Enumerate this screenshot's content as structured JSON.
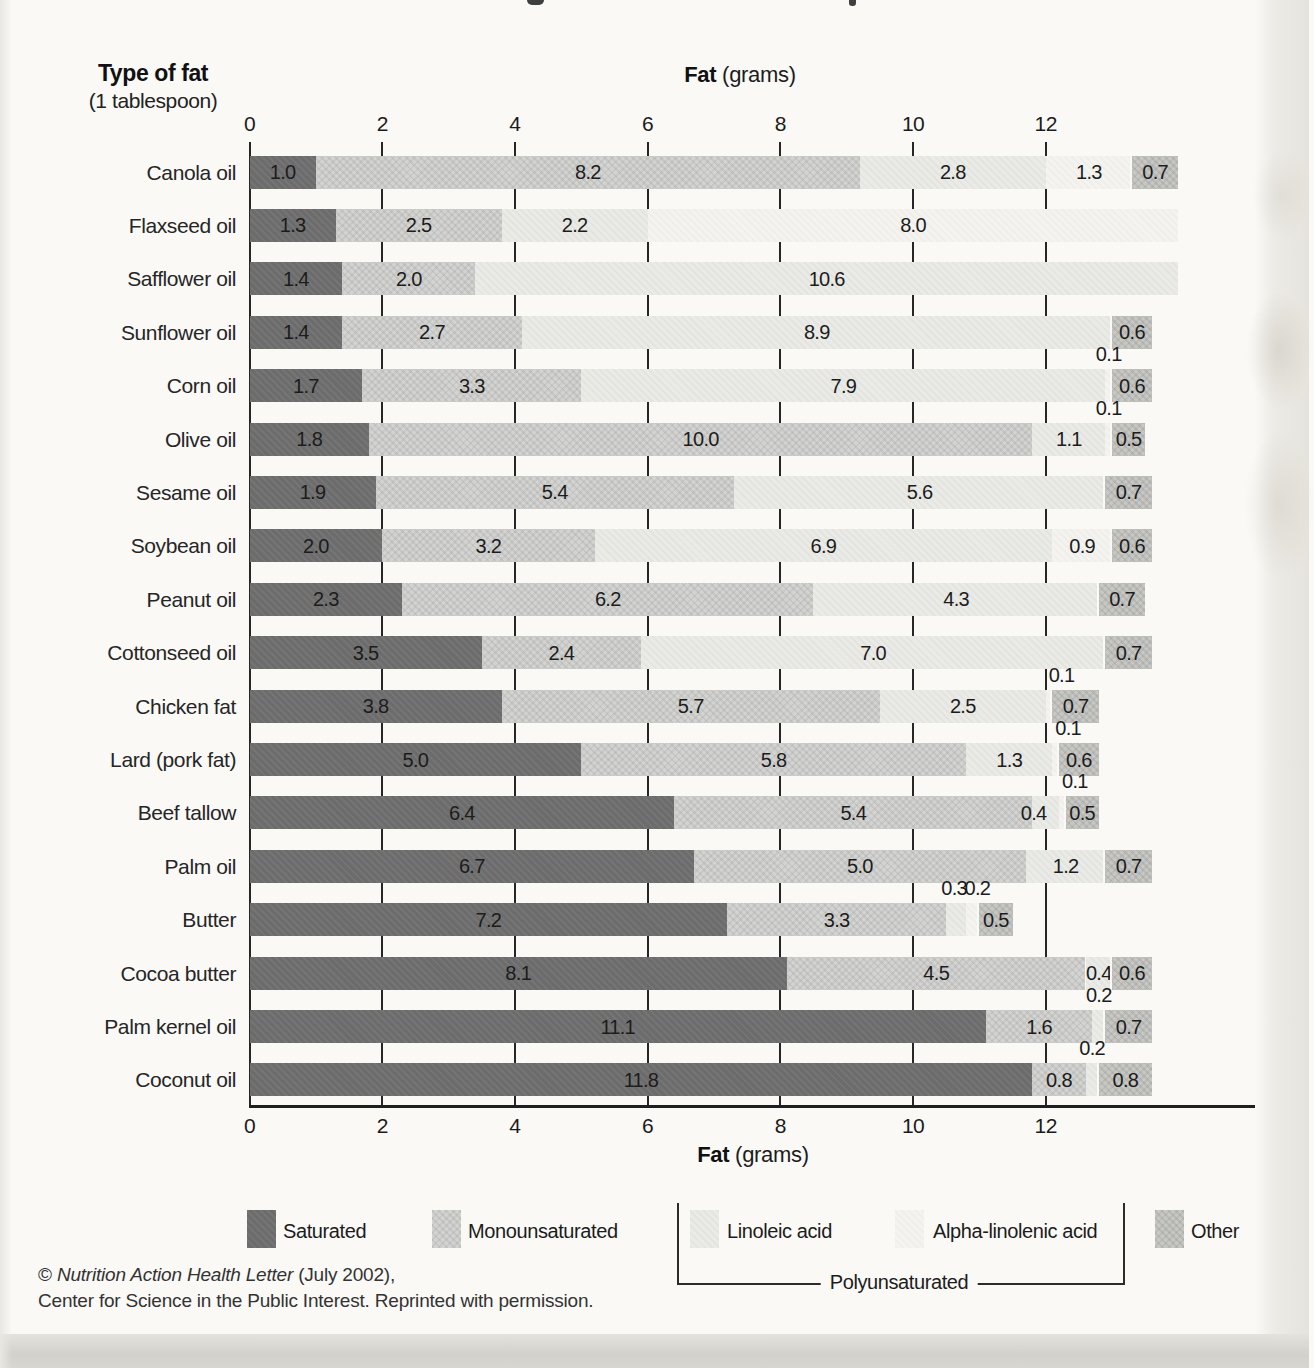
{
  "page": {
    "left_title_bold": "Type of fat",
    "left_title_sub": "(1 tablespoon)",
    "axis_title_bold": "Fat",
    "axis_title_rest": " (grams)",
    "footer_prefix": "© ",
    "footer_italic": "Nutrition Action Health Letter",
    "footer_suffix": " (July 2002),",
    "footer_line2": "Center for Science in the Public Interest. Reprinted with permission."
  },
  "axis": {
    "tick_values": [
      0,
      2,
      4,
      6,
      8,
      10,
      12
    ],
    "xlim": [
      0,
      14
    ]
  },
  "legend": {
    "items": [
      {
        "label": "Saturated",
        "color": "#6c6c6c"
      },
      {
        "label": "Monounsaturated",
        "color": "#d3d3d1"
      },
      {
        "label": "Linoleic acid",
        "color": "#eaeae7"
      },
      {
        "label": "Alpha-linolenic acid",
        "color": "#f4f3f0"
      },
      {
        "label": "Other",
        "color": "#c7c7c4"
      }
    ],
    "poly_label": "Polyunsaturated"
  },
  "chart_data": {
    "type": "bar",
    "orientation": "horizontal",
    "stacked": true,
    "title": "Fat (grams)",
    "xlabel": "Fat (grams)",
    "ylabel": "Type of fat (1 tablespoon)",
    "xlim": [
      0,
      14
    ],
    "grid": "vertical-ticks",
    "legend_position": "bottom",
    "categories": [
      "Canola oil",
      "Flaxseed oil",
      "Safflower oil",
      "Sunflower oil",
      "Corn oil",
      "Olive oil",
      "Sesame oil",
      "Soybean oil",
      "Peanut oil",
      "Cottonseed oil",
      "Chicken fat",
      "Lard (pork fat)",
      "Beef tallow",
      "Palm oil",
      "Butter",
      "Cocoa butter",
      "Palm kernel oil",
      "Coconut oil"
    ],
    "series": [
      {
        "name": "Saturated",
        "values": [
          1.0,
          1.3,
          1.4,
          1.4,
          1.7,
          1.8,
          1.9,
          2.0,
          2.3,
          3.5,
          3.8,
          5.0,
          6.4,
          6.7,
          7.2,
          8.1,
          11.1,
          11.8
        ]
      },
      {
        "name": "Monounsaturated",
        "values": [
          8.2,
          2.5,
          2.0,
          2.7,
          3.3,
          10.0,
          5.4,
          3.2,
          6.2,
          2.4,
          5.7,
          5.8,
          5.4,
          5.0,
          3.3,
          4.5,
          1.6,
          0.8
        ]
      },
      {
        "name": "Linoleic acid",
        "values": [
          2.8,
          2.2,
          10.6,
          8.9,
          7.9,
          1.1,
          5.6,
          6.9,
          4.3,
          7.0,
          2.5,
          1.3,
          0.4,
          1.2,
          0.3,
          0.4,
          0.2,
          0.2
        ]
      },
      {
        "name": "Alpha-linolenic acid",
        "values": [
          1.3,
          8.0,
          0,
          0,
          0.1,
          0.1,
          0,
          0.9,
          0,
          0,
          0.1,
          0.1,
          0.1,
          0,
          0.2,
          0,
          0,
          0
        ]
      },
      {
        "name": "Other",
        "values": [
          0.7,
          0,
          0,
          0.6,
          0.6,
          0.5,
          0.7,
          0.6,
          0.7,
          0.7,
          0.7,
          0.6,
          0.5,
          0.7,
          0.5,
          0.6,
          0.7,
          0.8
        ]
      }
    ],
    "rows": [
      {
        "name": "Canola oil",
        "segments": [
          {
            "t": "sat",
            "v": 1.0,
            "label": "1.0"
          },
          {
            "t": "mono",
            "v": 8.2,
            "label": "8.2"
          },
          {
            "t": "la",
            "v": 2.8,
            "label": "2.8"
          },
          {
            "t": "ala",
            "v": 1.3,
            "label": "1.3"
          },
          {
            "t": "other",
            "v": 0.7,
            "label": "0.7"
          }
        ],
        "above": []
      },
      {
        "name": "Flaxseed oil",
        "segments": [
          {
            "t": "sat",
            "v": 1.3,
            "label": "1.3"
          },
          {
            "t": "mono",
            "v": 2.5,
            "label": "2.5"
          },
          {
            "t": "la",
            "v": 2.2,
            "label": "2.2"
          },
          {
            "t": "ala",
            "v": 8.0,
            "label": "8.0"
          }
        ],
        "above": []
      },
      {
        "name": "Safflower oil",
        "segments": [
          {
            "t": "sat",
            "v": 1.4,
            "label": "1.4"
          },
          {
            "t": "mono",
            "v": 2.0,
            "label": "2.0"
          },
          {
            "t": "la",
            "v": 10.6,
            "label": "10.6"
          }
        ],
        "above": []
      },
      {
        "name": "Sunflower oil",
        "segments": [
          {
            "t": "sat",
            "v": 1.4,
            "label": "1.4"
          },
          {
            "t": "mono",
            "v": 2.7,
            "label": "2.7"
          },
          {
            "t": "la",
            "v": 8.9,
            "label": "8.9"
          },
          {
            "t": "other",
            "v": 0.6,
            "label": "0.6"
          }
        ],
        "above": []
      },
      {
        "name": "Corn oil",
        "segments": [
          {
            "t": "sat",
            "v": 1.7,
            "label": "1.7"
          },
          {
            "t": "mono",
            "v": 3.3,
            "label": "3.3"
          },
          {
            "t": "la",
            "v": 7.9,
            "label": "7.9"
          },
          {
            "t": "ala",
            "v": 0.1
          },
          {
            "t": "other",
            "v": 0.6,
            "label": "0.6"
          }
        ],
        "above": [
          {
            "text": "0.1",
            "x": 12.95,
            "anchor": "middle"
          }
        ]
      },
      {
        "name": "Olive oil",
        "segments": [
          {
            "t": "sat",
            "v": 1.8,
            "label": "1.8"
          },
          {
            "t": "mono",
            "v": 10.0,
            "label": "10.0"
          },
          {
            "t": "la",
            "v": 1.1,
            "label": "1.1"
          },
          {
            "t": "ala",
            "v": 0.1
          },
          {
            "t": "other",
            "v": 0.5,
            "label": "0.5"
          }
        ],
        "above": [
          {
            "text": "0.1",
            "x": 12.95,
            "anchor": "middle"
          }
        ]
      },
      {
        "name": "Sesame oil",
        "segments": [
          {
            "t": "sat",
            "v": 1.9,
            "label": "1.9"
          },
          {
            "t": "mono",
            "v": 5.4,
            "label": "5.4"
          },
          {
            "t": "la",
            "v": 5.6,
            "label": "5.6"
          },
          {
            "t": "other",
            "v": 0.7,
            "label": "0.7"
          }
        ],
        "above": []
      },
      {
        "name": "Soybean oil",
        "segments": [
          {
            "t": "sat",
            "v": 2.0,
            "label": "2.0"
          },
          {
            "t": "mono",
            "v": 3.2,
            "label": "3.2"
          },
          {
            "t": "la",
            "v": 6.9,
            "label": "6.9"
          },
          {
            "t": "ala",
            "v": 0.9,
            "label": "0.9"
          },
          {
            "t": "other",
            "v": 0.6,
            "label": "0.6"
          }
        ],
        "above": []
      },
      {
        "name": "Peanut oil",
        "segments": [
          {
            "t": "sat",
            "v": 2.3,
            "label": "2.3"
          },
          {
            "t": "mono",
            "v": 6.2,
            "label": "6.2"
          },
          {
            "t": "la",
            "v": 4.3,
            "label": "4.3"
          },
          {
            "t": "other",
            "v": 0.7,
            "label": "0.7"
          }
        ],
        "above": []
      },
      {
        "name": "Cottonseed oil",
        "segments": [
          {
            "t": "sat",
            "v": 3.5,
            "label": "3.5"
          },
          {
            "t": "mono",
            "v": 2.4,
            "label": "2.4"
          },
          {
            "t": "la",
            "v": 7.0,
            "label": "7.0"
          },
          {
            "t": "other",
            "v": 0.7,
            "label": "0.7"
          }
        ],
        "above": []
      },
      {
        "name": "Chicken fat",
        "segments": [
          {
            "t": "sat",
            "v": 3.8,
            "label": "3.8"
          },
          {
            "t": "mono",
            "v": 5.7,
            "label": "5.7"
          },
          {
            "t": "la",
            "v": 2.5,
            "label": "2.5"
          },
          {
            "t": "ala",
            "v": 0.1
          },
          {
            "t": "other",
            "v": 0.7,
            "label": "0.7"
          }
        ],
        "above": [
          {
            "text": "0.1",
            "x": 12.0,
            "anchor": "start"
          }
        ]
      },
      {
        "name": "Lard (pork fat)",
        "segments": [
          {
            "t": "sat",
            "v": 5.0,
            "label": "5.0"
          },
          {
            "t": "mono",
            "v": 5.8,
            "label": "5.8"
          },
          {
            "t": "la",
            "v": 1.3,
            "label": "1.3"
          },
          {
            "t": "ala",
            "v": 0.1
          },
          {
            "t": "other",
            "v": 0.6,
            "label": "0.6"
          }
        ],
        "above": [
          {
            "text": "0.1",
            "x": 12.1,
            "anchor": "start"
          }
        ]
      },
      {
        "name": "Beef tallow",
        "segments": [
          {
            "t": "sat",
            "v": 6.4,
            "label": "6.4"
          },
          {
            "t": "mono",
            "v": 5.4,
            "label": "5.4"
          },
          {
            "t": "la",
            "v": 0.4,
            "label": "0.4",
            "dx": -12
          },
          {
            "t": "ala",
            "v": 0.1
          },
          {
            "t": "other",
            "v": 0.5,
            "label": "0.5"
          }
        ],
        "above": [
          {
            "text": "0.1",
            "x": 12.2,
            "anchor": "start"
          }
        ]
      },
      {
        "name": "Palm oil",
        "segments": [
          {
            "t": "sat",
            "v": 6.7,
            "label": "6.7"
          },
          {
            "t": "mono",
            "v": 5.0,
            "label": "5.0"
          },
          {
            "t": "la",
            "v": 1.2,
            "label": "1.2"
          },
          {
            "t": "other",
            "v": 0.7,
            "label": "0.7"
          }
        ],
        "above": []
      },
      {
        "name": "Butter",
        "segments": [
          {
            "t": "sat",
            "v": 7.2,
            "label": "7.2"
          },
          {
            "t": "mono",
            "v": 3.3,
            "label": "3.3"
          },
          {
            "t": "la",
            "v": 0.3
          },
          {
            "t": "ala",
            "v": 0.2
          },
          {
            "t": "other",
            "v": 0.5,
            "label": "0.5"
          }
        ],
        "above": [
          {
            "text": "0.3",
            "x": 10.62,
            "anchor": "middle"
          },
          {
            "text": "0.2",
            "x": 10.97,
            "anchor": "middle"
          }
        ]
      },
      {
        "name": "Cocoa butter",
        "segments": [
          {
            "t": "sat",
            "v": 8.1,
            "label": "8.1"
          },
          {
            "t": "mono",
            "v": 4.5,
            "label": "4.5"
          },
          {
            "t": "la",
            "v": 0.4,
            "label": "0.4"
          },
          {
            "t": "other",
            "v": 0.6,
            "label": "0.6"
          }
        ],
        "above": []
      },
      {
        "name": "Palm kernel oil",
        "segments": [
          {
            "t": "sat",
            "v": 11.1,
            "label": "11.1"
          },
          {
            "t": "mono",
            "v": 1.6,
            "label": "1.6"
          },
          {
            "t": "la",
            "v": 0.2
          },
          {
            "t": "other",
            "v": 0.7,
            "label": "0.7"
          }
        ],
        "above": [
          {
            "text": "0.2",
            "x": 12.8,
            "anchor": "middle"
          }
        ]
      },
      {
        "name": "Coconut oil",
        "segments": [
          {
            "t": "sat",
            "v": 11.8,
            "label": "11.8"
          },
          {
            "t": "mono",
            "v": 0.8,
            "label": "0.8"
          },
          {
            "t": "la",
            "v": 0.2
          },
          {
            "t": "other",
            "v": 0.8,
            "label": "0.8"
          }
        ],
        "above": [
          {
            "text": "0.2",
            "x": 12.7,
            "anchor": "middle"
          }
        ]
      }
    ]
  }
}
